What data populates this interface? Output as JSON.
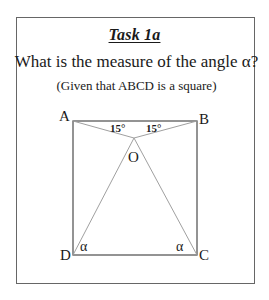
{
  "task": {
    "title": "Task 1a",
    "question": "What is the measure of the angle α?",
    "given": "(Given that ABCD is a square)"
  },
  "diagram": {
    "shape": "square",
    "vertices": {
      "A": "A",
      "B": "B",
      "C": "C",
      "D": "D",
      "O": "O"
    },
    "segments": [
      "AB",
      "BC",
      "CD",
      "DA",
      "AO",
      "BO",
      "OD",
      "OC"
    ],
    "angle_labels": {
      "angle_OAB": "15°",
      "angle_OBA": "15°",
      "angle_ODC": "α",
      "angle_OCD": "α"
    }
  }
}
